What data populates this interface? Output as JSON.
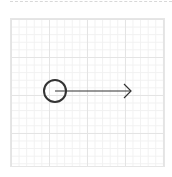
{
  "diagram": {
    "shapes": [
      {
        "type": "circle",
        "cx": 55,
        "cy": 91,
        "r": 11,
        "stroke": "#333333",
        "stroke_width": 2
      },
      {
        "type": "arrow",
        "x1": 55,
        "y1": 91,
        "x2": 131,
        "y2": 91,
        "stroke": "#333333",
        "stroke_width": 1.2,
        "head": "open"
      }
    ],
    "grid": {
      "visible": true,
      "color": "#e4e4e4"
    }
  }
}
